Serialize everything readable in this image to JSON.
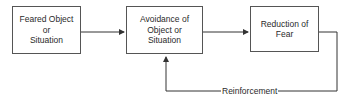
{
  "diagram": {
    "type": "flowchart",
    "nodes": [
      {
        "id": "feared",
        "label": "Feared Object\nor\nSituation"
      },
      {
        "id": "avoidance",
        "label": "Avoidance of\nObject or\nSituation"
      },
      {
        "id": "reduction",
        "label": "Reduction of\nFear"
      }
    ],
    "edges": [
      {
        "from": "feared",
        "to": "avoidance"
      },
      {
        "from": "avoidance",
        "to": "reduction"
      },
      {
        "from": "reduction",
        "to": "avoidance",
        "label": "Reinforcement"
      }
    ]
  }
}
